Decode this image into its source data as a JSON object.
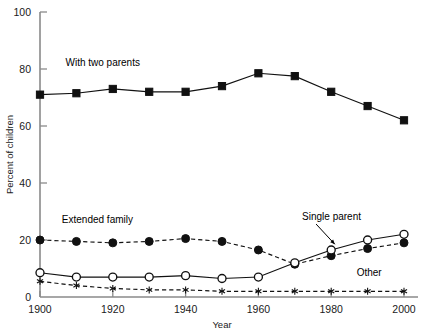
{
  "chart_data": {
    "type": "line",
    "title": "",
    "xlabel": "Year",
    "ylabel": "Percent of children",
    "xlim": [
      1900,
      2000
    ],
    "ylim": [
      0,
      100
    ],
    "grid": false,
    "legend_position": "inline-annotations",
    "x": [
      1900,
      1910,
      1920,
      1930,
      1940,
      1950,
      1960,
      1970,
      1980,
      1990,
      2000
    ],
    "xticks": [
      1900,
      1920,
      1940,
      1960,
      1980,
      2000
    ],
    "xticklabels": [
      "1900",
      "1920",
      "1940",
      "1960",
      "1980",
      "2000"
    ],
    "yticks": [
      0,
      20,
      40,
      60,
      80,
      100
    ],
    "yticklabels": [
      "0",
      "20",
      "40",
      "60",
      "80",
      "100"
    ],
    "series": [
      {
        "name": "With two parents",
        "marker": "filled-square",
        "linestyle": "solid",
        "color": "#111111",
        "values": [
          71,
          71.5,
          73,
          72,
          72,
          74,
          78.5,
          77.5,
          72,
          67,
          62
        ]
      },
      {
        "name": "Extended family",
        "marker": "filled-circle",
        "linestyle": "dashed",
        "color": "#111111",
        "values": [
          20,
          19.5,
          19,
          19.5,
          20.5,
          19.5,
          16.5,
          11.5,
          14.5,
          17,
          19
        ]
      },
      {
        "name": "Single parent",
        "marker": "open-circle",
        "linestyle": "solid",
        "color": "#111111",
        "values": [
          8.5,
          7,
          7,
          7,
          7.5,
          6.5,
          7,
          12,
          16.5,
          20,
          22
        ]
      },
      {
        "name": "Other",
        "marker": "asterisk",
        "linestyle": "dashed",
        "color": "#111111",
        "values": [
          5.5,
          4,
          3,
          2.5,
          2.5,
          2,
          2,
          2,
          2,
          2,
          2
        ]
      }
    ],
    "annotations": [
      {
        "text": "With two parents",
        "x": 1907,
        "y": 81,
        "anchor": "start"
      },
      {
        "text": "Extended family",
        "x": 1906,
        "y": 26,
        "anchor": "start"
      },
      {
        "text": "Single parent",
        "x": 1972,
        "y": 27,
        "anchor": "start",
        "arrow_to_x": 1981,
        "arrow_to_y": 18.5
      },
      {
        "text": "Other",
        "x": 1987,
        "y": 7.5,
        "anchor": "start"
      }
    ]
  }
}
